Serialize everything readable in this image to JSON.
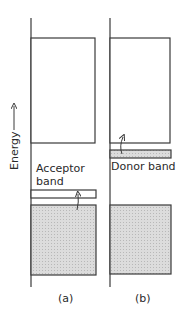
{
  "diagram": {
    "axis_label": "Energy",
    "panels": [
      {
        "id": "a",
        "caption": "(a)",
        "band_label_line1": "Acceptor",
        "band_label_line2": "band",
        "band_type": "acceptor"
      },
      {
        "id": "b",
        "caption": "(b)",
        "band_label": "Donor band",
        "band_type": "donor"
      }
    ],
    "colors": {
      "line": "#3a3a3a",
      "fill": "#d6d6d6",
      "empty": "#ffffff"
    }
  }
}
